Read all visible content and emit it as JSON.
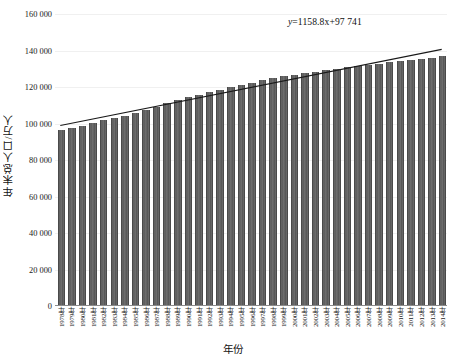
{
  "chart_data": {
    "type": "bar",
    "title": "",
    "xlabel": "年份",
    "ylabel": "年末总人口/万人",
    "ylim": [
      0,
      160000
    ],
    "ytick_labels": [
      "0",
      "20 000",
      "40 000",
      "60 000",
      "80 000",
      "100 000",
      "120 000",
      "140 000",
      "160 000"
    ],
    "ytick_values": [
      0,
      20000,
      40000,
      60000,
      80000,
      100000,
      120000,
      140000,
      160000
    ],
    "grid": true,
    "legend": false,
    "annotation": "y=1158.8x+97 741",
    "annotation_parts": {
      "y": "y",
      "rest": "=1158.8x+97 741"
    },
    "trendline": {
      "type": "linear",
      "slope": 1158.8,
      "intercept": 97741,
      "equation": "y=1158.8x+97 741"
    },
    "categories": [
      "1978年",
      "1979年",
      "1980年",
      "1981年",
      "1982年",
      "1983年",
      "1984年",
      "1985年",
      "1986年",
      "1987年",
      "1988年",
      "1989年",
      "1990年",
      "1991年",
      "1992年",
      "1993年",
      "1994年",
      "1995年",
      "1996年",
      "1997年",
      "1998年",
      "1999年",
      "2000年",
      "2001年",
      "2002年",
      "2003年",
      "2004年",
      "2005年",
      "2006年",
      "2007年",
      "2008年",
      "2009年",
      "2010年",
      "2011年",
      "2012年",
      "2013年",
      "2014年"
    ],
    "values": [
      96259,
      97542,
      98705,
      100072,
      101654,
      103008,
      104357,
      105851,
      107507,
      109300,
      111026,
      112704,
      114333,
      115823,
      117171,
      118517,
      119850,
      121121,
      122389,
      123626,
      124761,
      125786,
      126743,
      127627,
      128453,
      129227,
      129988,
      130756,
      131448,
      132129,
      132802,
      133450,
      134091,
      134735,
      135404,
      136072,
      136782
    ]
  },
  "colors": {
    "bar": "#5f5f5f",
    "trendline": "#1a1a1a",
    "grid": "#f0f0f0",
    "axis": "#8c8c8c",
    "text": "#1a1a1a",
    "background": "#ffffff"
  }
}
